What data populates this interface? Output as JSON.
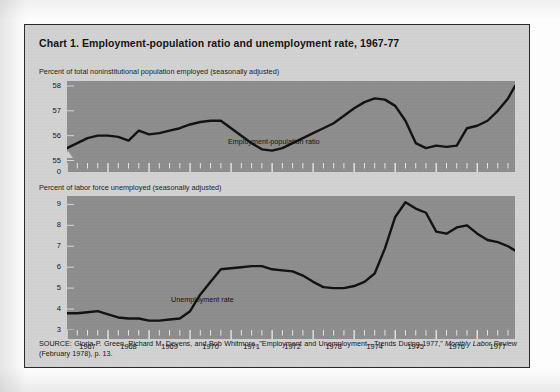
{
  "figure": {
    "title": "Chart 1. Employment-population ratio and unemployment rate, 1967-77",
    "source_line1": "SOURCE: Gloria P. Green, Richard M. Devens, and Bob Whitmore, \"Employment and Unemployment—Trends During 1977,\" ",
    "source_italic1": "Monthly",
    "source_italic2": "Labor Review",
    "source_line2": " (February 1978), p. 13."
  },
  "chart_data": [
    {
      "type": "line",
      "title": "Percent of total noninstitutional population employed (seasonally adjusted)",
      "xlabel": "",
      "ylabel": "Percent of total noninstitutional population employed (seasonally adjusted)",
      "ylim": [
        54.9,
        58.2
      ],
      "yticks": [
        "58",
        "57",
        "56",
        "55",
        "0"
      ],
      "ytick_values": [
        58,
        57,
        56,
        55
      ],
      "axis_break_below": "55",
      "xlim": [
        1967.0,
        1977.92
      ],
      "xticks": [
        "1967",
        "1968",
        "1969",
        "1970",
        "1971",
        "1972",
        "1973",
        "1974",
        "1975",
        "1976",
        "1977"
      ],
      "grid": false,
      "legend_position": "inline-annotation",
      "series": [
        {
          "name": "Employment-population ratio",
          "color": "#111111",
          "x": [
            1967.0,
            1967.25,
            1967.5,
            1967.75,
            1968.0,
            1968.25,
            1968.5,
            1968.75,
            1969.0,
            1969.25,
            1969.5,
            1969.75,
            1970.0,
            1970.25,
            1970.5,
            1970.75,
            1971.0,
            1971.25,
            1971.5,
            1971.75,
            1972.0,
            1972.25,
            1972.5,
            1972.75,
            1973.0,
            1973.25,
            1973.5,
            1973.75,
            1974.0,
            1974.25,
            1974.5,
            1974.75,
            1975.0,
            1975.25,
            1975.5,
            1975.75,
            1976.0,
            1976.25,
            1976.5,
            1976.75,
            1977.0,
            1977.25,
            1977.5,
            1977.75,
            1977.92
          ],
          "values": [
            55.5,
            55.7,
            55.9,
            56.0,
            56.0,
            55.95,
            55.8,
            56.2,
            56.05,
            56.1,
            56.2,
            56.3,
            56.45,
            56.55,
            56.6,
            56.6,
            56.3,
            56.0,
            55.7,
            55.45,
            55.4,
            55.5,
            55.7,
            55.9,
            56.1,
            56.3,
            56.5,
            56.8,
            57.1,
            57.35,
            57.5,
            57.45,
            57.2,
            56.6,
            55.7,
            55.5,
            55.6,
            55.55,
            55.6,
            56.3,
            56.4,
            56.6,
            57.0,
            57.5,
            58.0
          ]
        }
      ]
    },
    {
      "type": "line",
      "title": "Percent of labor force unemployed (seasonally adjusted)",
      "xlabel": "",
      "ylabel": "Percent of labor force unemployed (seasonally adjusted)",
      "ylim": [
        3.0,
        9.4
      ],
      "yticks": [
        "9",
        "8",
        "7",
        "6",
        "5",
        "4",
        "3"
      ],
      "ytick_values": [
        9,
        8,
        7,
        6,
        5,
        4,
        3
      ],
      "xlim": [
        1967.0,
        1977.92
      ],
      "xticks": [
        "1967",
        "1968",
        "1969",
        "1970",
        "1971",
        "1972",
        "1973",
        "1974",
        "1975",
        "1976",
        "1977"
      ],
      "grid": false,
      "legend_position": "inline-annotation",
      "series": [
        {
          "name": "Unemployment rate",
          "color": "#111111",
          "x": [
            1967.0,
            1967.25,
            1967.5,
            1967.75,
            1968.0,
            1968.25,
            1968.5,
            1968.75,
            1969.0,
            1969.25,
            1969.5,
            1969.75,
            1970.0,
            1970.25,
            1970.5,
            1970.75,
            1971.0,
            1971.25,
            1971.5,
            1971.75,
            1972.0,
            1972.25,
            1972.5,
            1972.75,
            1973.0,
            1973.25,
            1973.5,
            1973.75,
            1974.0,
            1974.25,
            1974.5,
            1974.75,
            1975.0,
            1975.25,
            1975.5,
            1975.75,
            1976.0,
            1976.25,
            1976.5,
            1976.75,
            1977.0,
            1977.25,
            1977.5,
            1977.75,
            1977.92
          ],
          "values": [
            3.8,
            3.8,
            3.85,
            3.9,
            3.75,
            3.6,
            3.55,
            3.55,
            3.45,
            3.45,
            3.5,
            3.55,
            3.9,
            4.7,
            5.3,
            5.9,
            5.95,
            6.0,
            6.05,
            6.05,
            5.9,
            5.85,
            5.8,
            5.6,
            5.3,
            5.05,
            5.0,
            5.0,
            5.1,
            5.3,
            5.7,
            6.9,
            8.4,
            9.1,
            8.8,
            8.6,
            7.7,
            7.6,
            7.9,
            8.0,
            7.6,
            7.3,
            7.2,
            7.0,
            6.8
          ]
        }
      ]
    }
  ]
}
